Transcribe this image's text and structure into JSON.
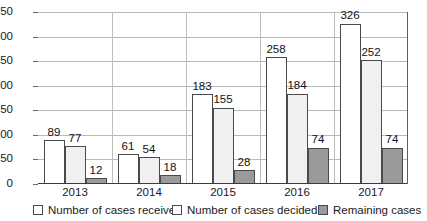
{
  "chart_data": {
    "type": "bar",
    "title": "",
    "subtitle": "",
    "xlabel": "",
    "ylabel": "",
    "categories": [
      "2013",
      "2014",
      "2015",
      "2016",
      "2017"
    ],
    "series": [
      {
        "name": "Number of cases received",
        "key": "received",
        "color": "#ffffff",
        "values": [
          89,
          61,
          183,
          258,
          326
        ]
      },
      {
        "name": "Number of cases decided",
        "key": "decided",
        "color": "#f0f0f0",
        "values": [
          77,
          54,
          155,
          184,
          252
        ]
      },
      {
        "name": "Remaining cases",
        "key": "remaining",
        "color": "#9a9a9a",
        "values": [
          12,
          18,
          28,
          74,
          74
        ]
      }
    ],
    "ylim": [
      0,
      350
    ],
    "ytick_step": 50,
    "yticks": [
      0,
      50,
      100,
      150,
      200,
      250,
      300,
      350
    ],
    "ytick_labels": [
      "0",
      "50",
      "100",
      "150",
      "200",
      "250",
      "300",
      "350"
    ],
    "grid": true,
    "grid_axis": "y",
    "legend_position": "bottom",
    "data_labels": true
  },
  "legend": {
    "items": [
      {
        "label": "Number of cases received",
        "swatch": "legend-swatch-received"
      },
      {
        "label": "Number of cases decided",
        "swatch": "legend-swatch-decided"
      },
      {
        "label": "Remaining cases",
        "swatch": "legend-swatch-remaining"
      }
    ]
  },
  "colors": {
    "grid": "#b9b9b9",
    "axis": "#3c3c3c",
    "bar_border": "#4a4a4a",
    "received": "#ffffff",
    "decided": "#f0f0f0",
    "remaining": "#9a9a9a",
    "text": "#1a1a1a"
  }
}
